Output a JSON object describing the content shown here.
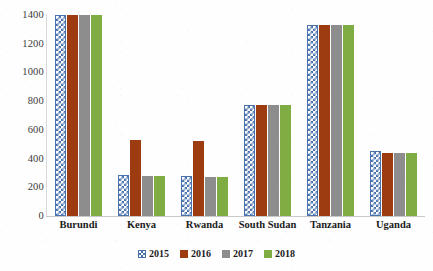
{
  "chart_data": {
    "type": "bar",
    "title": "",
    "subtitle": "",
    "xlabel": "",
    "ylabel": "",
    "ylim": [
      0,
      1400
    ],
    "yticks": [
      0,
      200,
      400,
      600,
      800,
      1000,
      1200,
      1400
    ],
    "grid": false,
    "legend_position": "bottom",
    "categories": [
      "Burundi",
      "Kenya",
      "Rwanda",
      "South Sudan",
      "Tanzania",
      "Uganda"
    ],
    "series": [
      {
        "name": "2015",
        "color": "#4a72ad",
        "pattern": "checkered",
        "values": [
          1400,
          285,
          280,
          770,
          1330,
          450
        ]
      },
      {
        "name": "2016",
        "color": "#9d3b11",
        "pattern": "solid",
        "values": [
          1400,
          530,
          525,
          770,
          1330,
          440
        ]
      },
      {
        "name": "2017",
        "color": "#8d8d8d",
        "pattern": "solid",
        "values": [
          1400,
          280,
          275,
          770,
          1330,
          440
        ]
      },
      {
        "name": "2018",
        "color": "#7fac43",
        "pattern": "solid",
        "values": [
          1400,
          280,
          275,
          770,
          1330,
          440
        ]
      }
    ]
  }
}
